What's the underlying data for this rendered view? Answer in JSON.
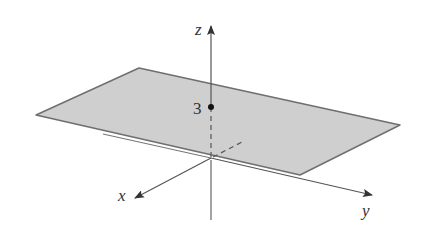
{
  "figure": {
    "axes": {
      "x": {
        "label": "x"
      },
      "y": {
        "label": "y"
      },
      "z": {
        "label": "z"
      },
      "origin_label": "0"
    },
    "point": {
      "label": "3"
    },
    "colors": {
      "plane_fill": "#cfcfcf",
      "plane_edge": "#6e6e6e",
      "axis": "#555555",
      "text": "#333333",
      "background": "#ffffff"
    }
  }
}
